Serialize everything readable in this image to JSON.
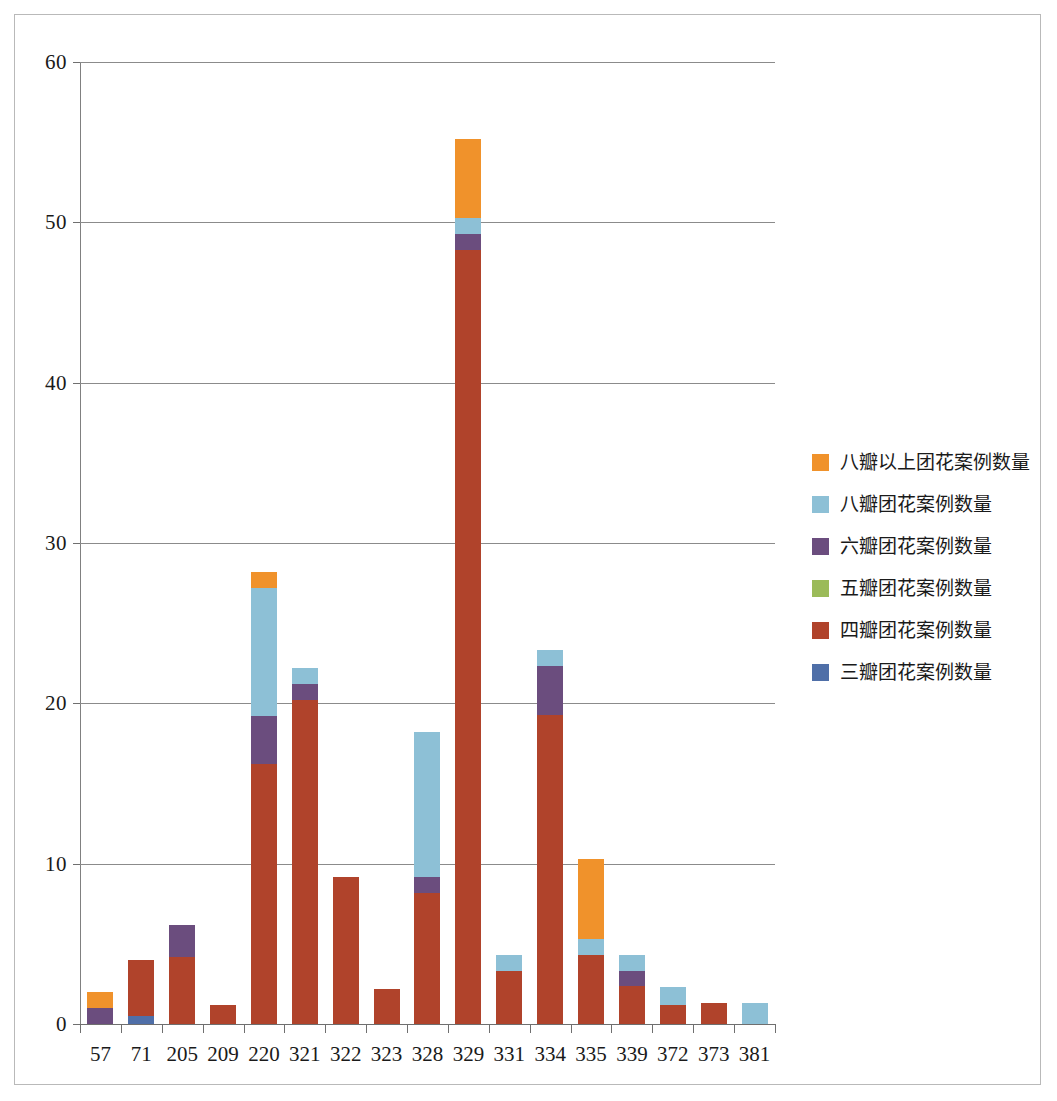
{
  "chart_data": {
    "type": "bar",
    "subtype": "stacked-bar",
    "title": "",
    "xlabel": "",
    "ylabel": "",
    "ylim": [
      0,
      60
    ],
    "yticks": [
      0,
      10,
      20,
      30,
      40,
      50,
      60
    ],
    "ytick_labels": [
      "0",
      "10",
      "20",
      "30",
      "40",
      "50",
      "60"
    ],
    "grid": "horizontal",
    "legend_position": "right",
    "categories": [
      "57",
      "71",
      "205",
      "209",
      "220",
      "321",
      "322",
      "323",
      "328",
      "329",
      "331",
      "334",
      "335",
      "339",
      "372",
      "373",
      "381"
    ],
    "series": [
      {
        "name": "三瓣团花案例数量",
        "color": "#4F6FA8",
        "values": [
          0,
          0.5,
          0,
          0,
          0,
          0,
          0,
          0,
          0,
          0,
          0,
          0,
          0,
          0,
          0,
          0,
          0
        ]
      },
      {
        "name": "四瓣团花案例数量",
        "color": "#B0432B",
        "values": [
          0,
          3.5,
          4.2,
          1.2,
          16.2,
          20.2,
          9.2,
          2.2,
          8.2,
          48.3,
          3.3,
          19.3,
          4.3,
          2.4,
          1.2,
          1.3,
          0
        ]
      },
      {
        "name": "五瓣团花案例数量",
        "color": "#9BBB59",
        "values": [
          0,
          0,
          0,
          0,
          0,
          0,
          0,
          0,
          0,
          0,
          0,
          0,
          0,
          0,
          0,
          0,
          0
        ]
      },
      {
        "name": "六瓣团花案例数量",
        "color": "#6B4D7E",
        "values": [
          1,
          0,
          2.0,
          0,
          3.0,
          1.0,
          0,
          0,
          1.0,
          1.0,
          0,
          3.0,
          0,
          0.9,
          0,
          0,
          0
        ]
      },
      {
        "name": "八瓣团花案例数量",
        "color": "#8DC0D6",
        "values": [
          0,
          0,
          0,
          0,
          8.0,
          1.0,
          0,
          0,
          9.0,
          1.0,
          1.0,
          1.0,
          1.0,
          1.0,
          1.1,
          0,
          1.3
        ]
      },
      {
        "name": "八瓣以上团花案例数量",
        "color": "#F0922B",
        "values": [
          1,
          0,
          0,
          0,
          1.0,
          0,
          0,
          0,
          0,
          4.9,
          0,
          0,
          5.0,
          0,
          0,
          0,
          0
        ]
      }
    ],
    "totals": [
      2,
      4,
      6.2,
      1.2,
      28.2,
      22.2,
      9.2,
      2.2,
      18.2,
      55.2,
      4.3,
      23.3,
      10.3,
      4.3,
      2.3,
      1.3,
      1.3
    ],
    "legend_order_top_to_bottom": [
      "八瓣以上团花案例数量",
      "八瓣团花案例数量",
      "六瓣团花案例数量",
      "五瓣团花案例数量",
      "四瓣团花案例数量",
      "三瓣团花案例数量"
    ]
  },
  "legend": {
    "items": [
      {
        "label": "八瓣以上团花案例数量",
        "color": "#F0922B",
        "icon": "legend-swatch-icon"
      },
      {
        "label": "八瓣团花案例数量",
        "color": "#8DC0D6",
        "icon": "legend-swatch-icon"
      },
      {
        "label": "六瓣团花案例数量",
        "color": "#6B4D7E",
        "icon": "legend-swatch-icon"
      },
      {
        "label": "五瓣团花案例数量",
        "color": "#9BBB59",
        "icon": "legend-swatch-icon"
      },
      {
        "label": "四瓣团花案例数量",
        "color": "#B0432B",
        "icon": "legend-swatch-icon"
      },
      {
        "label": "三瓣团花案例数量",
        "color": "#4F6FA8",
        "icon": "legend-swatch-icon"
      }
    ]
  }
}
